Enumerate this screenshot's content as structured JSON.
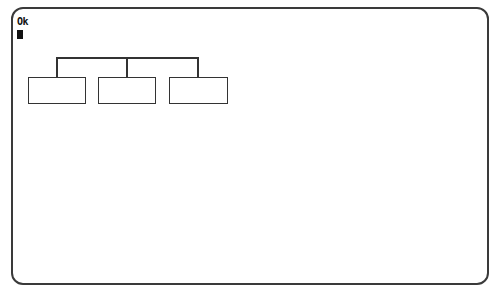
{
  "terminal": {
    "prompt_text": "Ok",
    "cursor": "block"
  },
  "diagram": {
    "type": "org-chart",
    "root_line": {
      "x1": 56,
      "x2": 198,
      "y": 58
    },
    "boxes": [
      {
        "id": "box-1",
        "label": "",
        "x": 28,
        "y": 77,
        "w": 57,
        "h": 26
      },
      {
        "id": "box-2",
        "label": "",
        "x": 98,
        "y": 77,
        "w": 57,
        "h": 26
      },
      {
        "id": "box-3",
        "label": "",
        "x": 169,
        "y": 77,
        "w": 58,
        "h": 26
      }
    ]
  },
  "caption": {
    "text": ""
  },
  "colors": {
    "frame": "#3a3a3a",
    "ink": "#333333",
    "background": "#ffffff"
  }
}
